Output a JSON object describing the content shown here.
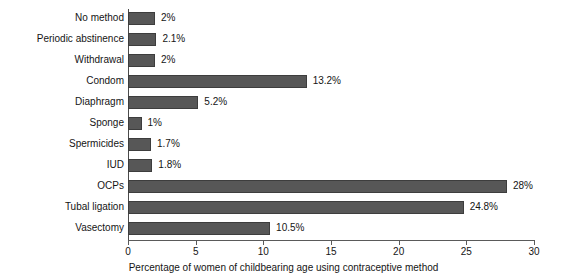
{
  "chart_data": {
    "type": "bar",
    "orientation": "horizontal",
    "title": "",
    "subtitle": "",
    "xlabel": "Percentage of women of childbearing age using contraceptive method",
    "ylabel": "",
    "xlim": [
      0,
      30
    ],
    "xticks": [
      0,
      5,
      10,
      15,
      20,
      25,
      30
    ],
    "xtick_labels": [
      "0",
      "5",
      "10",
      "15",
      "20",
      "25",
      "30"
    ],
    "grid": false,
    "legend": false,
    "bar_color": "#575757",
    "bar_edge_color": "#3d3d3d",
    "axis_color": "#5a5a5a",
    "categories": [
      "No method",
      "Periodic abstinence",
      "Withdrawal",
      "Condom",
      "Diaphragm",
      "Sponge",
      "Spermicides",
      "IUD",
      "OCPs",
      "Tubal ligation",
      "Vasectomy"
    ],
    "values": [
      2,
      2.1,
      2,
      13.2,
      5.2,
      1,
      1.7,
      1.8,
      28,
      24.8,
      10.5
    ],
    "value_labels": [
      "2%",
      "2.1%",
      "2%",
      "13.2%",
      "5.2%",
      "1%",
      "1.7%",
      "1.8%",
      "28%",
      "24.8%",
      "10.5%"
    ]
  }
}
